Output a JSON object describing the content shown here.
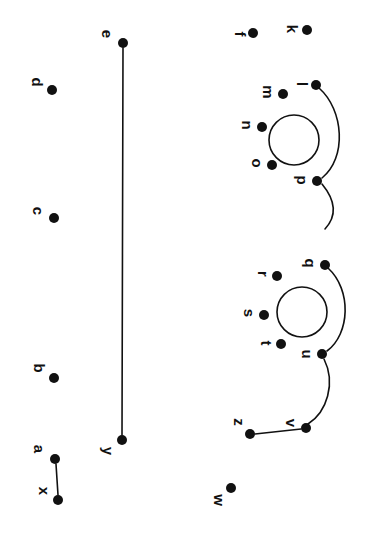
{
  "diagram": {
    "orientation_degrees": 90,
    "background_color": "#ffffff",
    "node_color": "#111111",
    "edge_color": "#111111",
    "node_radius": 5,
    "nodes": [
      {
        "id": "a",
        "label": "a",
        "cx": 55,
        "cy": 459,
        "label_x": 39,
        "label_y": 449
      },
      {
        "id": "b",
        "label": "b",
        "cx": 54,
        "cy": 378,
        "label_x": 39,
        "label_y": 368
      },
      {
        "id": "c",
        "label": "c",
        "cx": 54,
        "cy": 218,
        "label_x": 38,
        "label_y": 211
      },
      {
        "id": "d",
        "label": "d",
        "cx": 52,
        "cy": 90,
        "label_x": 37,
        "label_y": 82
      },
      {
        "id": "e",
        "label": "e",
        "cx": 123,
        "cy": 43,
        "label_x": 107,
        "label_y": 34
      },
      {
        "id": "f",
        "label": "f",
        "cx": 253,
        "cy": 33,
        "label_x": 240,
        "label_y": 34
      },
      {
        "id": "k",
        "label": "k",
        "cx": 307,
        "cy": 30,
        "label_x": 292,
        "label_y": 29
      },
      {
        "id": "l",
        "label": "l",
        "cx": 316,
        "cy": 85,
        "label_x": 302,
        "label_y": 84
      },
      {
        "id": "m",
        "label": "m",
        "cx": 283,
        "cy": 94,
        "label_x": 268,
        "label_y": 92
      },
      {
        "id": "n",
        "label": "n",
        "cx": 262,
        "cy": 127,
        "label_x": 247,
        "label_y": 125
      },
      {
        "id": "o",
        "label": "o",
        "cx": 272,
        "cy": 165,
        "label_x": 257,
        "label_y": 163
      },
      {
        "id": "p",
        "label": "p",
        "cx": 317,
        "cy": 181,
        "label_x": 302,
        "label_y": 180
      },
      {
        "id": "q",
        "label": "q",
        "cx": 325,
        "cy": 265,
        "label_x": 310,
        "label_y": 263
      },
      {
        "id": "r",
        "label": "r",
        "cx": 277,
        "cy": 276,
        "label_x": 263,
        "label_y": 274
      },
      {
        "id": "s",
        "label": "s",
        "cx": 264,
        "cy": 315,
        "label_x": 249,
        "label_y": 313
      },
      {
        "id": "t",
        "label": "t",
        "cx": 281,
        "cy": 344,
        "label_x": 266,
        "label_y": 343
      },
      {
        "id": "u",
        "label": "u",
        "cx": 322,
        "cy": 354,
        "label_x": 307,
        "label_y": 354
      },
      {
        "id": "v",
        "label": "v",
        "cx": 306,
        "cy": 428,
        "label_x": 291,
        "label_y": 423
      },
      {
        "id": "w",
        "label": "w",
        "cx": 231,
        "cy": 488,
        "label_x": 219,
        "label_y": 500
      },
      {
        "id": "x",
        "label": "x",
        "cx": 58,
        "cy": 500,
        "label_x": 44,
        "label_y": 491
      },
      {
        "id": "y",
        "label": "y",
        "cx": 122,
        "cy": 440,
        "label_x": 108,
        "label_y": 451
      },
      {
        "id": "z",
        "label": "z",
        "cx": 250,
        "cy": 434,
        "label_x": 239,
        "label_y": 422
      }
    ],
    "straight_edges": [
      {
        "id": "edge-e-y",
        "from": "e",
        "to": "y",
        "x1": 123,
        "y1": 48,
        "x2": 122,
        "y2": 435
      },
      {
        "id": "edge-a-x",
        "from": "a",
        "to": "x",
        "x1": 56,
        "y1": 464,
        "x2": 58,
        "y2": 495
      },
      {
        "id": "edge-z-v",
        "from": "z",
        "to": "v",
        "x1": 255,
        "y1": 434,
        "x2": 301,
        "y2": 429
      }
    ],
    "curved_edges": [
      {
        "id": "arc-l-p",
        "from": "l",
        "to": "p",
        "path": "M 319 88 C 344 110, 347 158, 322 178"
      },
      {
        "id": "tail-p",
        "from": "p",
        "to": "",
        "path": "M 322 184 C 336 201, 337 216, 325 229"
      },
      {
        "id": "arc-q-u",
        "from": "q",
        "to": "u",
        "path": "M 328 268 C 352 290, 350 334, 327 351"
      },
      {
        "id": "tail-u-v",
        "from": "u",
        "to": "v",
        "path": "M 324 359 C 336 383, 327 412, 308 424"
      }
    ],
    "rings": [
      {
        "id": "ring-upper",
        "cx": 294,
        "cy": 140,
        "r": 25
      },
      {
        "id": "ring-lower",
        "cx": 302,
        "cy": 312,
        "r": 25
      }
    ]
  }
}
